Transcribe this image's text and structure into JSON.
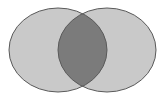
{
  "diagram": {
    "type": "venn",
    "sets": [
      {
        "id": "A",
        "label": ""
      },
      {
        "id": "B",
        "label": ""
      }
    ],
    "highlighted_region": "A∩B",
    "colors": {
      "set_fill": "#c9c9c9",
      "intersection_fill": "#7b7b7b",
      "outline": "#5a5a5a",
      "background": "#ffffff"
    }
  }
}
